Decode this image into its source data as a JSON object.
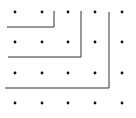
{
  "diagram": {
    "type": "dot-grid-with-gnomons",
    "width": 136,
    "height": 118,
    "colors": {
      "background": "#ffffff",
      "dot": "#111111",
      "line": "#333333"
    },
    "grid": {
      "columns_x": [
        15,
        42,
        68,
        95,
        122
      ],
      "rows_y": [
        12,
        42,
        73,
        103
      ],
      "dot_radius": 1.4
    },
    "gnomons": [
      {
        "label": "L1",
        "points": [
          [
            7,
            27
          ],
          [
            54,
            27
          ],
          [
            54,
            11
          ]
        ]
      },
      {
        "label": "L2",
        "points": [
          [
            8,
            57
          ],
          [
            81,
            57
          ],
          [
            81,
            11
          ]
        ]
      },
      {
        "label": "L3",
        "points": [
          [
            5,
            88
          ],
          [
            109,
            88
          ],
          [
            109,
            12
          ]
        ]
      }
    ]
  }
}
